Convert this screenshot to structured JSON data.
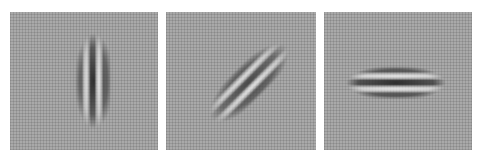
{
  "figure": {
    "panels": [
      {
        "id": "gabor-vertical",
        "orientation_deg": 0,
        "label": ""
      },
      {
        "id": "gabor-diagonal",
        "orientation_deg": 45,
        "label": ""
      },
      {
        "id": "gabor-horizontal",
        "orientation_deg": 90,
        "label": ""
      }
    ],
    "colors": {
      "background_grey": "#a9a9a9",
      "dark_band": "#3a3a3a",
      "light_band": "#e8e8e8"
    }
  }
}
